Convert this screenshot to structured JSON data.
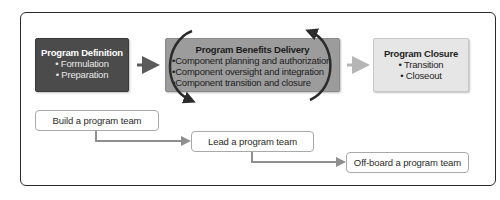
{
  "diagram": {
    "type": "program-lifecycle-flow",
    "phases": [
      {
        "title": "Program Definition",
        "items": [
          "Formulation",
          "Preparation"
        ],
        "fill": "#4b4b4b",
        "text_color": "#ffffff"
      },
      {
        "title": "Program Benefits Delivery",
        "items": [
          "Component planning and authorization",
          "Component oversight and integration",
          "Component transition and closure"
        ],
        "fill": "#9c9c9c",
        "text_color": "#1c1c1c"
      },
      {
        "title": "Program Closure",
        "items": [
          "Transition",
          "Closeout"
        ],
        "fill": "#e6e6e6",
        "text_color": "#1f1f1f"
      }
    ],
    "phase_arrows": [
      {
        "from": "Program Definition",
        "to": "Program Benefits Delivery",
        "color": "#5a5a5a"
      },
      {
        "from": "Program Benefits Delivery",
        "to": "Program Closure",
        "color": "#b5b5b5"
      }
    ],
    "cycle_arrows": {
      "around": "Program Benefits Delivery",
      "color": "#2b2b2b"
    },
    "team_steps": [
      {
        "label": "Build a program team"
      },
      {
        "label": "Lead a program team"
      },
      {
        "label": "Off-board a program team"
      }
    ],
    "step_connector_color": "#8f8f8f",
    "bullet": "•"
  }
}
